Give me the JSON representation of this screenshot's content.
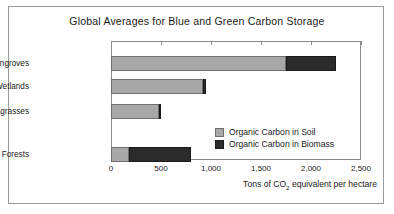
{
  "chart_data": {
    "type": "bar",
    "orientation": "horizontal",
    "stacked": true,
    "title": "Global Averages for Blue and Green Carbon Storage",
    "xlabel_prefix": "Tons of CO",
    "xlabel_sub": "2",
    "xlabel_suffix": " equivalent per hectare",
    "ylabel": "",
    "categories": [
      "Seacoast Mangroves",
      "Saltwater Wetlands",
      "Seagrasses",
      "Tropical Forests"
    ],
    "series": [
      {
        "name": "Organic Carbon in Soil",
        "color": "#a8a8a8",
        "values": [
          1750,
          920,
          480,
          180
        ]
      },
      {
        "name": "Organic Carbon in Biomass",
        "color": "#2b2b2b",
        "values": [
          500,
          30,
          20,
          620
        ]
      }
    ],
    "totals": [
      2250,
      950,
      500,
      800
    ],
    "xlim": [
      0,
      2500
    ],
    "xticks": [
      0,
      500,
      1000,
      1500,
      2000,
      2500
    ],
    "xtick_labels": [
      "0",
      "500",
      "1,000",
      "1,500",
      "2,000",
      "2,500"
    ],
    "grid": false,
    "legend_position": "inside-right-lower"
  },
  "colors": {
    "soil": "#a8a8a8",
    "biomass": "#2b2b2b",
    "frame": "#8c8c8c",
    "outer_border": "#9a9a9a",
    "background": "#ffffff",
    "text": "#1a1a1a"
  }
}
